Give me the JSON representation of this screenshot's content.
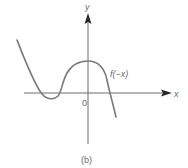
{
  "figure": {
    "function_label": "f(−x)",
    "x_axis_label": "x",
    "y_axis_label": "y",
    "origin_label": "0",
    "caption": "(b)"
  },
  "colors": {
    "curve": "#7a7a7a",
    "axis": "#6f6f6f",
    "text": "#6a6a6a"
  }
}
